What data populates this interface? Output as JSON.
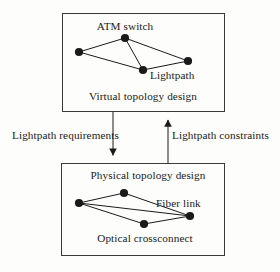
{
  "figure": {
    "type": "block-diagram",
    "background_color": "#fdfdfc",
    "line_color": "#1a1a1a",
    "node_color": "#1a1a1a"
  },
  "top_box": {
    "caption": "Virtual topology design",
    "node_label": "ATM switch",
    "edge_label": "Lightpath",
    "graph": {
      "nodes": [
        {
          "id": "t-top",
          "x": 125,
          "y": 38
        },
        {
          "id": "t-left",
          "x": 79,
          "y": 52
        },
        {
          "id": "t-bottom",
          "x": 143,
          "y": 70
        },
        {
          "id": "t-right",
          "x": 188,
          "y": 61
        }
      ],
      "edges": [
        [
          "t-left",
          "t-top"
        ],
        [
          "t-top",
          "t-right"
        ],
        [
          "t-left",
          "t-bottom"
        ],
        [
          "t-bottom",
          "t-right"
        ],
        [
          "t-top",
          "t-bottom"
        ]
      ]
    },
    "rect": {
      "x": 62,
      "y": 13,
      "width": 163,
      "height": 99
    }
  },
  "bottom_box": {
    "caption": "Physical topology design",
    "node_label": "Optical crossconnect",
    "edge_label": "Fiber link",
    "graph": {
      "nodes": [
        {
          "id": "b-top",
          "x": 124,
          "y": 193
        },
        {
          "id": "b-left",
          "x": 79,
          "y": 203
        },
        {
          "id": "b-bottom",
          "x": 144,
          "y": 224
        },
        {
          "id": "b-right",
          "x": 190,
          "y": 216
        }
      ],
      "edges": [
        [
          "b-left",
          "b-top"
        ],
        [
          "b-top",
          "b-right"
        ],
        [
          "b-left",
          "b-bottom"
        ],
        [
          "b-bottom",
          "b-right"
        ],
        [
          "b-left",
          "b-right"
        ]
      ]
    },
    "rect": {
      "x": 61,
      "y": 163,
      "width": 164,
      "height": 93
    }
  },
  "connectors": {
    "downward": {
      "label": "Lightpath requirements",
      "direction": "down",
      "x": 113,
      "y_start": 112,
      "y_end": 163
    },
    "upward": {
      "label": "Lightpath constraints",
      "direction": "up",
      "x": 168,
      "y_start": 163,
      "y_end": 112
    }
  }
}
